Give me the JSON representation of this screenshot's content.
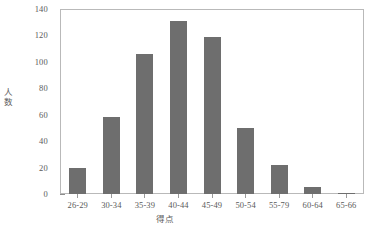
{
  "chart_data": {
    "type": "bar",
    "title": "",
    "subtitle": "",
    "xlabel": "得点",
    "ylabel": "人数",
    "categories": [
      "26-29",
      "30-34",
      "35-39",
      "40-44",
      "45-49",
      "50-54",
      "55-79",
      "60-64",
      "65-66"
    ],
    "values": [
      20,
      58,
      106,
      131,
      119,
      50,
      22,
      5,
      1
    ],
    "series": [
      {
        "name": "人数",
        "values": [
          20,
          58,
          106,
          131,
          119,
          50,
          22,
          5,
          1
        ]
      }
    ],
    "ylim": [
      0,
      140
    ],
    "y_major_ticks": [
      0,
      20,
      40,
      60,
      80,
      100,
      120,
      140
    ],
    "y_tick_labels": [
      "0",
      "20",
      "40",
      "60",
      "80",
      "100",
      "120",
      "140"
    ],
    "y_minor_tick_step": 5,
    "grid": false,
    "legend": false,
    "legend_position": "none",
    "bar_color": "#6e6e6e",
    "frame_color": "#b9b9b9",
    "text_color": "#5a5a5a",
    "background": "#ffffff"
  }
}
